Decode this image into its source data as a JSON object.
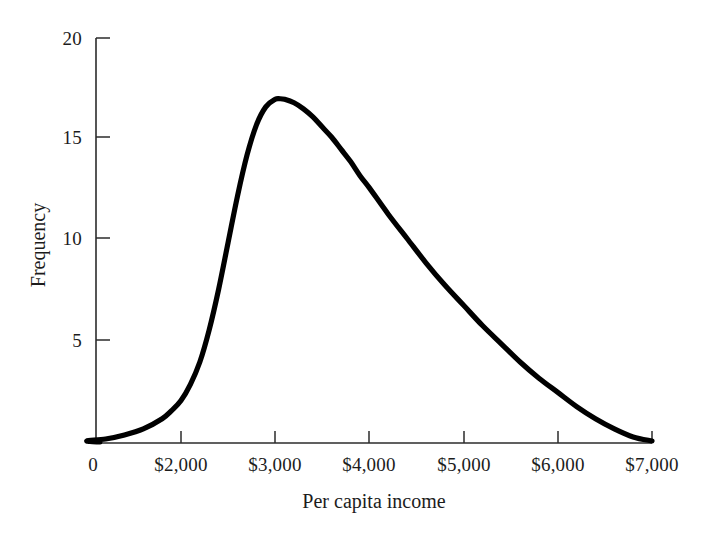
{
  "chart_data": {
    "type": "line",
    "title": "",
    "subtitle": "",
    "xlabel": "Per capita income",
    "ylabel": "Frequency",
    "xlim": [
      0,
      7000
    ],
    "ylim": [
      0,
      20
    ],
    "grid": false,
    "legend": null,
    "annotations": [],
    "x_tick_labels": [
      "0",
      "$2,000",
      "$3,000",
      "$4,000",
      "$5,000",
      "$6,000",
      "$7,000"
    ],
    "x_tick_values": [
      0,
      2000,
      3000,
      4000,
      5000,
      6000,
      7000
    ],
    "y_tick_labels": [
      "5",
      "10",
      "15",
      "20"
    ],
    "y_tick_values": [
      5,
      10,
      15,
      20
    ],
    "series": [
      {
        "name": "Frequency distribution of per capita income",
        "color": "#000000",
        "x": [
          1000,
          1200,
          1400,
          1600,
          1800,
          1900,
          2000,
          2100,
          2200,
          2300,
          2400,
          2500,
          2600,
          2700,
          2800,
          2900,
          3000,
          3050,
          3100,
          3200,
          3300,
          3400,
          3500,
          3600,
          3700,
          3800,
          3900,
          4000,
          4200,
          4400,
          4600,
          4800,
          5000,
          5200,
          5400,
          5600,
          5800,
          6000,
          6200,
          6400,
          6600,
          6800,
          7000
        ],
        "y": [
          0.1,
          0.2,
          0.4,
          0.7,
          1.2,
          1.6,
          2.1,
          2.9,
          4.0,
          5.6,
          7.6,
          9.9,
          12.2,
          14.2,
          15.7,
          16.6,
          16.97,
          17.0,
          16.97,
          16.8,
          16.5,
          16.1,
          15.6,
          15.1,
          14.5,
          13.9,
          13.2,
          12.6,
          11.3,
          10.1,
          8.9,
          7.8,
          6.8,
          5.8,
          4.9,
          4.0,
          3.2,
          2.5,
          1.8,
          1.2,
          0.7,
          0.3,
          0.1
        ]
      }
    ],
    "peak": {
      "x": 3050,
      "y": 17
    },
    "axis_color": "#2b2b2b",
    "curve_color": "#000000",
    "background_color": "#ffffff"
  },
  "axes": {
    "y_ticks": [
      {
        "label": "20",
        "value": 20
      },
      {
        "label": "15",
        "value": 15
      },
      {
        "label": "10",
        "value": 10
      },
      {
        "label": "5",
        "value": 5
      }
    ],
    "x_ticks": [
      {
        "label": "0",
        "value": 0
      },
      {
        "label": "$2,000",
        "value": 2000
      },
      {
        "label": "$3,000",
        "value": 3000
      },
      {
        "label": "$4,000",
        "value": 4000
      },
      {
        "label": "$5,000",
        "value": 5000
      },
      {
        "label": "$6,000",
        "value": 6000
      },
      {
        "label": "$7,000",
        "value": 7000
      }
    ],
    "x_title": "Per capita income",
    "y_title": "Frequency"
  }
}
